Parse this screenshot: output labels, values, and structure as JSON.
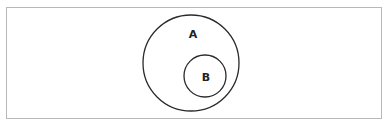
{
  "diagram": {
    "type": "venn-subset",
    "frame": {
      "x": 6.5,
      "y": 7.5,
      "width": 375,
      "height": 111,
      "stroke": "#b8b8b8"
    },
    "sets": [
      {
        "id": "A",
        "label": "A",
        "cx": 191,
        "cy": 63,
        "r": 48,
        "label_x": 193,
        "label_y": 34
      },
      {
        "id": "B",
        "label": "B",
        "cx": 205,
        "cy": 76,
        "r": 21,
        "label_x": 206,
        "label_y": 77
      }
    ],
    "stroke_color": "#2a2a2a"
  }
}
